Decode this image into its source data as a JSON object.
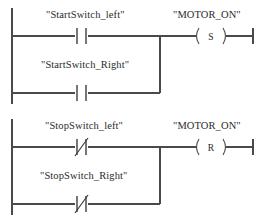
{
  "diagram": {
    "type": "plc-ladder-logic",
    "rungs": [
      {
        "id": "rung-1",
        "function": "set",
        "branches": [
          {
            "operand": "\"StartSwitch_left\"",
            "contact_type": "normally-open",
            "contact_symbol": "-| |-"
          },
          {
            "operand": "\"StartSwitch_Right\"",
            "contact_type": "normally-open",
            "contact_symbol": "-| |-"
          }
        ],
        "output": {
          "operand": "\"MOTOR_ON\"",
          "coil_type": "set-coil",
          "coil_letter": "S"
        }
      },
      {
        "id": "rung-2",
        "function": "reset",
        "branches": [
          {
            "operand": "\"StopSwitch_left\"",
            "contact_type": "normally-closed",
            "contact_symbol": "-|/|-"
          },
          {
            "operand": "\"StopSwitch_Right\"",
            "contact_type": "normally-closed",
            "contact_symbol": "-|/|-"
          }
        ],
        "output": {
          "operand": "\"MOTOR_ON\"",
          "coil_type": "reset-coil",
          "coil_letter": "R"
        }
      }
    ]
  },
  "colors": {
    "wire": "#4a4a4a",
    "symbol": "#3d3d3d",
    "text": "#2b2b2b",
    "background": "#ffffff"
  }
}
